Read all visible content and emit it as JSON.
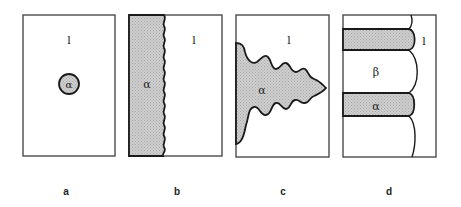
{
  "figure": {
    "panels": [
      {
        "id": "a",
        "caption": "a",
        "labels": {
          "liquid": "l",
          "alpha": "α"
        },
        "description": "small spherical alpha nucleus in liquid"
      },
      {
        "id": "b",
        "caption": "b",
        "labels": {
          "liquid": "l",
          "alpha": "α"
        },
        "description": "planar solid-liquid interface with small perturbations"
      },
      {
        "id": "c",
        "caption": "c",
        "labels": {
          "liquid": "l",
          "alpha": "α"
        },
        "description": "dendritic alpha growth into liquid"
      },
      {
        "id": "d",
        "caption": "d",
        "labels": {
          "liquid": "l",
          "alpha": "α",
          "beta": "β"
        },
        "description": "lamellar alpha/beta eutectic growth with cellular front"
      }
    ],
    "colors": {
      "outline": "#1a1a1a",
      "frame": "#4a4a4a",
      "alpha_fill": "#c8c8c8",
      "background": "#ffffff"
    }
  }
}
